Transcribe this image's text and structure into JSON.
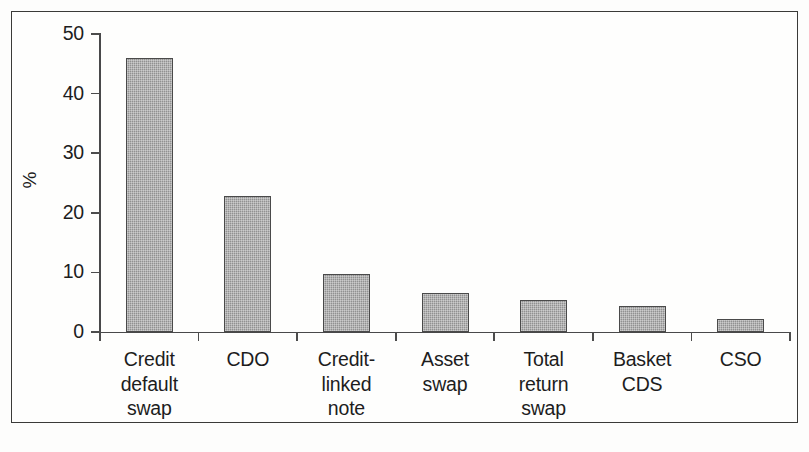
{
  "chart_data": {
    "type": "bar",
    "title": "",
    "subtitle": "",
    "xlabel": "",
    "ylabel": "%",
    "ylim": [
      0,
      50
    ],
    "yticks": [
      0,
      10,
      20,
      30,
      40,
      50
    ],
    "ytick_labels": [
      "0",
      "10",
      "20",
      "30",
      "40",
      "50"
    ],
    "grid": false,
    "legend": false,
    "legend_position": "none",
    "bar_color": "#9a9a9a",
    "bar_edge_color": "#4a4a4a",
    "axis_color": "#49494a",
    "categories": [
      "Credit\ndefault\nswap",
      "CDO",
      "Credit-\nlinked\nnote",
      "Asset\nswap",
      "Total\nreturn\nswap",
      "Basket\nCDS",
      "CSO"
    ],
    "values": [
      46.0,
      22.8,
      9.7,
      6.5,
      5.3,
      4.4,
      2.2
    ]
  },
  "axis": {
    "y_title": "%"
  }
}
